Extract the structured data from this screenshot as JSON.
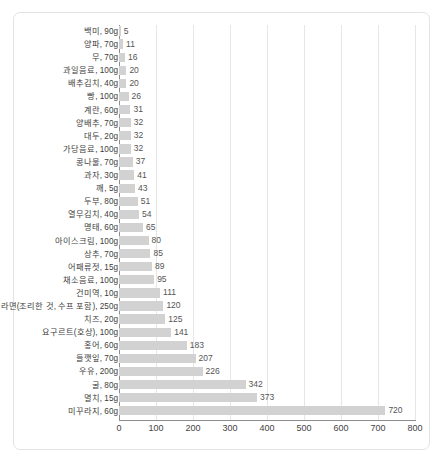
{
  "chart_data": {
    "type": "bar",
    "orientation": "horizontal",
    "title": "",
    "xlabel": "",
    "ylabel": "",
    "xlim": [
      0,
      800
    ],
    "xticks": [
      0,
      100,
      200,
      300,
      400,
      500,
      600,
      700,
      800
    ],
    "grid": true,
    "grid_axis": "x",
    "legend": false,
    "bar_color": "#d2d2d2",
    "categories": [
      "백미, 90g",
      "양파, 70g",
      "무, 70g",
      "과일음료, 100g",
      "배추김치, 40g",
      "빵, 100g",
      "계란, 60g",
      "양배추, 70g",
      "대두, 20g",
      "가당음료, 100g",
      "콩나물, 70g",
      "과자, 30g",
      "깨, 5g",
      "두부, 80g",
      "열무김치, 40g",
      "명태, 60g",
      "아이스크림, 100g",
      "상추, 70g",
      "어패류젓, 15g",
      "채소음료, 100g",
      "건미역, 10g",
      "라면(조리한 것, 수프 포함), 250g",
      "치즈, 20g",
      "요구르트(호상), 100g",
      "홍어, 60g",
      "들깻잎, 70g",
      "우유, 200g",
      "굴, 80g",
      "멸치, 15g",
      "미꾸라지, 60g"
    ],
    "values": [
      5,
      11,
      16,
      20,
      20,
      26,
      31,
      32,
      32,
      32,
      37,
      41,
      43,
      51,
      54,
      65,
      80,
      85,
      89,
      95,
      111,
      120,
      125,
      141,
      183,
      207,
      226,
      342,
      373,
      720
    ]
  }
}
